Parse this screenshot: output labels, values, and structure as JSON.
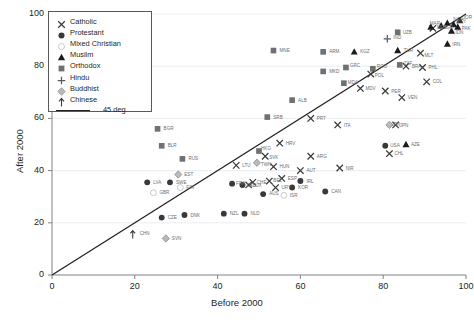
{
  "chart_data": {
    "type": "scatter",
    "title": "",
    "xlabel": "Before 2000",
    "ylabel": "After 2000",
    "xlim": [
      0,
      100
    ],
    "ylim": [
      0,
      100
    ],
    "xticks": [
      0,
      20,
      40,
      60,
      80,
      100
    ],
    "yticks": [
      0,
      20,
      40,
      60,
      80,
      100
    ],
    "grid": true,
    "legend_position": "top-left",
    "reference_line": {
      "label": "45 deg",
      "slope": 1,
      "intercept": 0
    },
    "legend": [
      {
        "label": "Catholic",
        "marker": "x",
        "color": "#3b3b3d"
      },
      {
        "label": "Protestant",
        "marker": "circle",
        "color": "#39393b"
      },
      {
        "label": "Mixed Christian",
        "marker": "open-circle",
        "color": "#cfcfd1"
      },
      {
        "label": "Muslim",
        "marker": "triangle",
        "color": "#1b1b1d"
      },
      {
        "label": "Orthodox",
        "marker": "square",
        "color": "#6f7072"
      },
      {
        "label": "Hindu",
        "marker": "plus",
        "color": "#5a5b5d"
      },
      {
        "label": "Buddhist",
        "marker": "diamond",
        "color": "#9a9b9d"
      },
      {
        "label": "Chinese",
        "marker": "arrow",
        "color": "#3b3b3d"
      }
    ],
    "points": [
      {
        "code": "CHN",
        "group": "Chinese",
        "x": 19.5,
        "y": 15.5,
        "lx": 7,
        "ly": -1.5
      },
      {
        "code": "SVN",
        "group": "Buddhist",
        "x": 27.5,
        "y": 14.0,
        "lx": 6,
        "ly": 0
      },
      {
        "code": "GBR",
        "group": "Mixed Christian",
        "x": 24.5,
        "y": 31.5,
        "lx": 6,
        "ly": 0
      },
      {
        "code": "CZE",
        "group": "Protestant",
        "x": 26.5,
        "y": 22.0,
        "lx": 6,
        "ly": 0
      },
      {
        "code": "LVA",
        "group": "Protestant",
        "x": 23.0,
        "y": 35.5,
        "lx": 6,
        "ly": 0
      },
      {
        "code": "SWE",
        "group": "Protestant",
        "x": 28.5,
        "y": 35.5,
        "lx": 6,
        "ly": 0
      },
      {
        "code": "DNK",
        "group": "Protestant",
        "x": 32.0,
        "y": 23.0,
        "lx": 6,
        "ly": 0
      },
      {
        "code": "NZL",
        "group": "Protestant",
        "x": 41.5,
        "y": 23.5,
        "lx": 6,
        "ly": 0
      },
      {
        "code": "NLD",
        "group": "Protestant",
        "x": 46.5,
        "y": 23.5,
        "lx": 6,
        "ly": 0
      },
      {
        "code": "BGR",
        "group": "Orthodox",
        "x": 25.5,
        "y": 56.0,
        "lx": 6,
        "ly": 0
      },
      {
        "code": "BLR",
        "group": "Orthodox",
        "x": 26.5,
        "y": 49.5,
        "lx": 6,
        "ly": 0
      },
      {
        "code": "RUS",
        "group": "Orthodox",
        "x": 31.5,
        "y": 44.5,
        "lx": 6,
        "ly": 0
      },
      {
        "code": "EST",
        "group": "Buddhist",
        "x": 30.5,
        "y": 38.5,
        "lx": 6,
        "ly": 0
      },
      {
        "code": "FIN",
        "group": "Mixed Christian",
        "x": 31.0,
        "y": 33.5,
        "lx": 6,
        "ly": 0
      },
      {
        "code": "HKG",
        "group": "Orthodox",
        "x": 50.0,
        "y": 47.5,
        "lx": 2,
        "ly": -3
      },
      {
        "code": "SVK",
        "group": "Catholic",
        "x": 51.5,
        "y": 45.5,
        "lx": 4,
        "ly": 1.5
      },
      {
        "code": "TWN",
        "group": "Buddhist",
        "x": 49.5,
        "y": 43.0,
        "lx": 4,
        "ly": 1.5
      },
      {
        "code": "LTU",
        "group": "Catholic",
        "x": 44.5,
        "y": 42.0,
        "lx": 6,
        "ly": 0
      },
      {
        "code": "HUN",
        "group": "Catholic",
        "x": 53.5,
        "y": 41.5,
        "lx": 6,
        "ly": 0
      },
      {
        "code": "AUT",
        "group": "Catholic",
        "x": 60.0,
        "y": 40.0,
        "lx": 6,
        "ly": 0
      },
      {
        "code": "BEL",
        "group": "Catholic",
        "x": 52.5,
        "y": 36.0,
        "lx": 4,
        "ly": -1
      },
      {
        "code": "ESP",
        "group": "Catholic",
        "x": 55.5,
        "y": 37.0,
        "lx": 6,
        "ly": 0
      },
      {
        "code": "IRL",
        "group": "Protestant",
        "x": 60.0,
        "y": 36.0,
        "lx": 6,
        "ly": 0
      },
      {
        "code": "LUX",
        "group": "Catholic",
        "x": 47.5,
        "y": 34.5,
        "lx": 4,
        "ly": 0
      },
      {
        "code": "URY",
        "group": "Catholic",
        "x": 54.0,
        "y": 33.5,
        "lx": 6,
        "ly": 0
      },
      {
        "code": "KOR",
        "group": "Protestant",
        "x": 58.0,
        "y": 33.5,
        "lx": 6,
        "ly": 0
      },
      {
        "code": "CAN",
        "group": "Protestant",
        "x": 66.0,
        "y": 32.0,
        "lx": 6,
        "ly": 0
      },
      {
        "code": "AUS",
        "group": "Protestant",
        "x": 51.0,
        "y": 31.0,
        "lx": 6,
        "ly": -1
      },
      {
        "code": "ISR",
        "group": "Mixed Christian",
        "x": 56.0,
        "y": 30.5,
        "lx": 6,
        "ly": 0
      },
      {
        "code": "FRA",
        "group": "Protestant",
        "x": 43.5,
        "y": 35.0,
        "lx": 4,
        "ly": 0
      },
      {
        "code": "DEU",
        "group": "Protestant",
        "x": 46.0,
        "y": 34.5,
        "lx": 4,
        "ly": 0
      },
      {
        "code": "CHE",
        "group": "Catholic",
        "x": 48.5,
        "y": 35.5,
        "lx": 4,
        "ly": 0
      },
      {
        "code": "MNE",
        "group": "Orthodox",
        "x": 53.5,
        "y": 86.0,
        "lx": 6,
        "ly": 0
      },
      {
        "code": "ARM",
        "group": "Orthodox",
        "x": 65.5,
        "y": 85.5,
        "lx": 6,
        "ly": 0
      },
      {
        "code": "KGZ",
        "group": "Muslim",
        "x": 73.0,
        "y": 85.5,
        "lx": 6,
        "ly": 0
      },
      {
        "code": "MKD",
        "group": "Orthodox",
        "x": 65.5,
        "y": 78.0,
        "lx": 6,
        "ly": 0
      },
      {
        "code": "GRC",
        "group": "Orthodox",
        "x": 71.0,
        "y": 79.5,
        "lx": 4,
        "ly": -2
      },
      {
        "code": "ROU",
        "group": "Orthodox",
        "x": 77.5,
        "y": 79.0,
        "lx": 4,
        "ly": -2
      },
      {
        "code": "POL",
        "group": "Catholic",
        "x": 77.0,
        "y": 77.0,
        "lx": 4,
        "ly": 1.5
      },
      {
        "code": "MDA",
        "group": "Orthodox",
        "x": 70.5,
        "y": 73.5,
        "lx": 4,
        "ly": -1
      },
      {
        "code": "MDV",
        "group": "Catholic",
        "x": 74.5,
        "y": 71.5,
        "lx": 5,
        "ly": 0
      },
      {
        "code": "ALB",
        "group": "Orthodox",
        "x": 58.0,
        "y": 67.0,
        "lx": 6,
        "ly": 0
      },
      {
        "code": "SRB",
        "group": "Orthodox",
        "x": 52.0,
        "y": 60.5,
        "lx": 6,
        "ly": 0
      },
      {
        "code": "PRT",
        "group": "Catholic",
        "x": 62.5,
        "y": 60.0,
        "lx": 6,
        "ly": 0
      },
      {
        "code": "ITA",
        "group": "Catholic",
        "x": 69.0,
        "y": 57.5,
        "lx": 6,
        "ly": 0
      },
      {
        "code": "HRV",
        "group": "Catholic",
        "x": 55.0,
        "y": 50.5,
        "lx": 6,
        "ly": 0
      },
      {
        "code": "ARG",
        "group": "Catholic",
        "x": 62.5,
        "y": 45.5,
        "lx": 6,
        "ly": 0
      },
      {
        "code": "NIR",
        "group": "Catholic",
        "x": 69.5,
        "y": 41.0,
        "lx": 6,
        "ly": 0
      },
      {
        "code": "IND",
        "group": "Hindu",
        "x": 81.0,
        "y": 90.5,
        "lx": 6,
        "ly": -1
      },
      {
        "code": "UZB",
        "group": "Orthodox",
        "x": 83.5,
        "y": 93.0,
        "lx": 5,
        "ly": 0
      },
      {
        "code": "TUR",
        "group": "Muslim",
        "x": 83.5,
        "y": 86.0,
        "lx": 6,
        "ly": 0
      },
      {
        "code": "BRA",
        "group": "Catholic",
        "x": 85.5,
        "y": 80.0,
        "lx": 6,
        "ly": 0
      },
      {
        "code": "ZAF",
        "group": "Orthodox",
        "x": 84.0,
        "y": 80.5,
        "lx": 4,
        "ly": -1
      },
      {
        "code": "MLT",
        "group": "Catholic",
        "x": 89.0,
        "y": 85.0,
        "lx": 4,
        "ly": 2
      },
      {
        "code": "PHL",
        "group": "Catholic",
        "x": 89.5,
        "y": 79.5,
        "lx": 6,
        "ly": 0
      },
      {
        "code": "COL",
        "group": "Catholic",
        "x": 90.5,
        "y": 74.0,
        "lx": 6,
        "ly": 0
      },
      {
        "code": "PER",
        "group": "Catholic",
        "x": 80.5,
        "y": 70.5,
        "lx": 6,
        "ly": 0
      },
      {
        "code": "VEN",
        "group": "Catholic",
        "x": 84.5,
        "y": 68.0,
        "lx": 6,
        "ly": 0
      },
      {
        "code": "JPN",
        "group": "Buddhist",
        "x": 81.5,
        "y": 57.5,
        "lx": 2,
        "ly": -1
      },
      {
        "code": "JPN2",
        "group": "Catholic",
        "x": 83.0,
        "y": 57.5,
        "lx": 4,
        "ly": 0
      },
      {
        "code": "USA",
        "group": "Protestant",
        "x": 80.5,
        "y": 49.5,
        "lx": 5,
        "ly": 0
      },
      {
        "code": "AZE",
        "group": "Muslim",
        "x": 85.5,
        "y": 50.0,
        "lx": 5,
        "ly": 0
      },
      {
        "code": "CHL",
        "group": "Catholic",
        "x": 81.5,
        "y": 46.5,
        "lx": 5,
        "ly": 0
      },
      {
        "code": "IRN",
        "group": "Muslim",
        "x": 95.5,
        "y": 88.5,
        "lx": 5,
        "ly": 0
      },
      {
        "code": "MEX",
        "group": "Catholic",
        "x": 92.0,
        "y": 94.5,
        "lx": 4,
        "ly": -1
      },
      {
        "code": "MAR",
        "group": "Muslim",
        "x": 91.5,
        "y": 95.0,
        "lx": -1,
        "ly": -4
      },
      {
        "code": "NGA",
        "group": "Muslim",
        "x": 95.5,
        "y": 96.5,
        "lx": 0,
        "ly": -4
      },
      {
        "code": "EGY",
        "group": "Muslim",
        "x": 97.0,
        "y": 96.0,
        "lx": 3,
        "ly": -3
      },
      {
        "code": "PAK",
        "group": "Muslim",
        "x": 98.0,
        "y": 95.0,
        "lx": 4,
        "ly": 1
      },
      {
        "code": "JOR",
        "group": "Muslim",
        "x": 98.5,
        "y": 97.5,
        "lx": 3,
        "ly": -3
      },
      {
        "code": "IDN",
        "group": "Muslim",
        "x": 96.5,
        "y": 93.5,
        "lx": 4,
        "ly": 1.5
      },
      {
        "code": "BGD",
        "group": "Muslim",
        "x": 94.0,
        "y": 95.5,
        "lx": 2,
        "ly": 2
      }
    ]
  }
}
